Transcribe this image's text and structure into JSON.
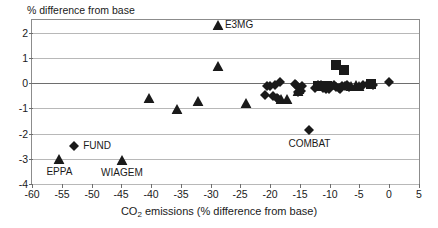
{
  "figure": {
    "y_axis_caption": "% difference from base",
    "x_axis_caption_pre": "CO",
    "x_axis_caption_sub": "2",
    "x_axis_caption_post": " emissions (% difference from base)"
  },
  "chart_data": {
    "type": "scatter",
    "title": "",
    "xlabel": "CO2 emissions (% difference from base)",
    "ylabel": "% difference from base",
    "xlim": [
      -60,
      5
    ],
    "ylim": [
      -4,
      2.5
    ],
    "xticks": [
      -60,
      -55,
      -50,
      -45,
      -40,
      -35,
      -30,
      -25,
      -20,
      -15,
      -10,
      -5,
      0,
      5
    ],
    "yticks": [
      2,
      1,
      0,
      -1,
      -2,
      -3,
      -4
    ],
    "xticklabels": [
      "-60",
      "-55",
      "-50",
      "-45",
      "-40",
      "-35",
      "-30",
      "-25",
      "-20",
      "-15",
      "-10",
      "-5",
      "0",
      "5"
    ],
    "yticklabels": [
      "2",
      "1",
      "0",
      "-1",
      "-2",
      "-3",
      "-4"
    ],
    "grid": "horizontal",
    "legend": "none",
    "marker_color": "#1a1a1a",
    "annotations": [
      {
        "text": "E3MG",
        "x": -27.6,
        "y": 2.3,
        "anchor": "left-of-point"
      },
      {
        "text": "FUND",
        "x": -51.4,
        "y": -2.5,
        "anchor": "left-of-point"
      },
      {
        "text": "EPPA",
        "x": -55.4,
        "y": -3.52,
        "anchor": "below-point"
      },
      {
        "text": "WIAGEM",
        "x": -44.9,
        "y": -3.58,
        "anchor": "below-point"
      },
      {
        "text": "COMBAT",
        "x": -13.4,
        "y": -2.42,
        "anchor": "below-point"
      }
    ],
    "series": [
      {
        "name": "triangles",
        "marker": "triangle",
        "points": [
          [
            -55.4,
            -3.0
          ],
          [
            -44.9,
            -3.05
          ],
          [
            -40.3,
            -0.58
          ],
          [
            -35.6,
            -1.03
          ],
          [
            -32.2,
            -0.7
          ],
          [
            -28.7,
            0.68
          ],
          [
            -28.8,
            2.3
          ],
          [
            -24.1,
            -0.78
          ],
          [
            -18.2,
            -0.62
          ],
          [
            -17.2,
            -0.62
          ],
          [
            -15.4,
            -0.3
          ],
          [
            -15.1,
            -0.22
          ],
          [
            -6.4,
            -0.12
          ],
          [
            -5.6,
            -0.08
          ],
          [
            -5.0,
            -0.1
          ]
        ]
      },
      {
        "name": "diamonds",
        "marker": "diamond",
        "points": [
          [
            -52.9,
            -2.5
          ],
          [
            -20.9,
            -0.48
          ],
          [
            -20.6,
            -0.13
          ],
          [
            -20.1,
            -0.1
          ],
          [
            -19.6,
            -0.52
          ],
          [
            -19.2,
            -0.08
          ],
          [
            -18.9,
            -0.6
          ],
          [
            -18.6,
            -0.62
          ],
          [
            -18.3,
            0.04
          ],
          [
            -15.9,
            -0.05
          ],
          [
            -15.6,
            -0.07
          ],
          [
            -15.3,
            -0.34
          ],
          [
            -14.9,
            -0.3
          ],
          [
            -14.6,
            -0.12
          ],
          [
            -13.4,
            -1.87
          ],
          [
            -12.4,
            -0.2
          ],
          [
            -12.0,
            -0.08
          ],
          [
            -11.4,
            -0.06
          ],
          [
            -11.1,
            -0.18
          ],
          [
            -10.7,
            -0.22
          ],
          [
            -10.2,
            -0.24
          ],
          [
            -9.7,
            -0.1
          ],
          [
            -9.3,
            -0.08
          ],
          [
            -8.9,
            -0.17
          ],
          [
            -8.5,
            -0.2
          ],
          [
            -8.2,
            -0.22
          ],
          [
            -7.9,
            -0.12
          ],
          [
            -7.5,
            -0.1
          ],
          [
            -7.1,
            -0.08
          ],
          [
            -6.8,
            -0.14
          ],
          [
            -4.4,
            -0.06
          ],
          [
            -3.6,
            -0.04
          ],
          [
            -2.7,
            -0.08
          ],
          [
            -0.1,
            0.05
          ]
        ]
      },
      {
        "name": "squares",
        "marker": "square",
        "points": [
          [
            -8.9,
            0.7
          ],
          [
            -7.6,
            0.52
          ],
          [
            -12.0,
            -0.1
          ],
          [
            -10.4,
            -0.12
          ],
          [
            -3.1,
            -0.04
          ]
        ]
      }
    ]
  }
}
